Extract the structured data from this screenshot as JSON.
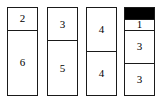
{
  "chart_data": {
    "type": "bar",
    "title": "",
    "subtitle": "",
    "xlabel": "",
    "ylabel": "",
    "grid": false,
    "legend": null,
    "stacked": true,
    "orientation": "vertical",
    "ylim": [
      0,
      8
    ],
    "categories": [
      "1",
      "2",
      "3",
      "4"
    ],
    "series": [
      {
        "name": "top",
        "values": [
          2,
          3,
          4,
          1
        ]
      },
      {
        "name": "bottom",
        "values": [
          6,
          5,
          4,
          3
        ]
      }
    ],
    "columns": [
      {
        "name": "column-1",
        "total": 8,
        "segments": [
          {
            "label": "2",
            "value": 2,
            "filled": false
          },
          {
            "label": "6",
            "value": 6,
            "filled": false
          }
        ]
      },
      {
        "name": "column-2",
        "total": 8,
        "segments": [
          {
            "label": "3",
            "value": 3,
            "filled": false
          },
          {
            "label": "5",
            "value": 5,
            "filled": false
          }
        ]
      },
      {
        "name": "column-3",
        "total": 8,
        "segments": [
          {
            "label": "4",
            "value": 4,
            "filled": false
          },
          {
            "label": "4",
            "value": 4,
            "filled": false
          }
        ]
      },
      {
        "name": "column-4",
        "total": 8,
        "segments": [
          {
            "label": "",
            "value": 1,
            "filled": true
          },
          {
            "label": "1",
            "value": 1,
            "filled": false
          },
          {
            "label": "3",
            "value": 3,
            "filled": false
          },
          {
            "label": "3",
            "value": 3,
            "filled": false
          }
        ]
      }
    ],
    "colors": {
      "outline": "#1a1a1a",
      "fill_empty": "#ffffff",
      "fill_solid": "#000000",
      "text": "#000000",
      "background": "#ffffff"
    },
    "geometry": {
      "columns_x": [
        7,
        47,
        86,
        124
      ],
      "column_width": 31,
      "top_y": 7,
      "bottom_y": 96
    }
  }
}
